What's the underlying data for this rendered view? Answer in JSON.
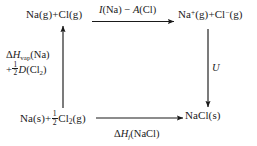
{
  "diagram": {
    "background_color": "#ffffff",
    "line_color": "#1a1a1a",
    "nodes": {
      "top_left": {
        "text": "Na(g) + Cl(g)",
        "parts": [
          "Na(g)",
          "+",
          "Cl(g)"
        ]
      },
      "top_right": {
        "text": "Na+(g) + Cl-(g)",
        "species_1": "Na",
        "charge_1": "+",
        "state_1": "(g)",
        "plus": "+",
        "species_2": "Cl",
        "charge_2": "−",
        "state_2": "(g)"
      },
      "bottom_left": {
        "text": "Na(s) + 1/2 Cl2(g)",
        "species_1": "Na(s)",
        "plus": "+",
        "frac_num": "1",
        "frac_den": "2",
        "species_2": "Cl",
        "sub_2": "2",
        "state_2": "(g)"
      },
      "bottom_right": {
        "text": "NaCl(s)"
      }
    },
    "edges": {
      "top": {
        "label": "I(Na) − A(Cl)",
        "sym_1": "I",
        "arg_1": "(Na)",
        "op": "−",
        "sym_2": "A",
        "arg_2": "(Cl)",
        "direction": "right"
      },
      "right": {
        "label": "U",
        "direction": "down"
      },
      "left": {
        "line1_delta": "Δ",
        "line1_H": "H",
        "line1_sub": "vap",
        "line1_arg": "(Na)",
        "line2_plus": "+",
        "line2_frac_num": "1",
        "line2_frac_den": "2",
        "line2_sym": "D",
        "line2_arg": "(Cl",
        "line2_sub": "2",
        "line2_close": ")",
        "label": "ΔHvap(Na) + 1/2 D(Cl2)",
        "direction": "up"
      },
      "bottom": {
        "delta": "Δ",
        "H": "H",
        "sub": "f",
        "arg": "(NaCl)",
        "label": "ΔHf(NaCl)",
        "direction": "right"
      }
    }
  }
}
